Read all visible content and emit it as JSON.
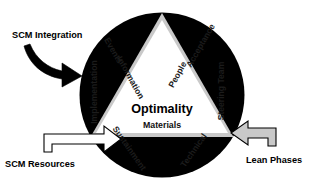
{
  "diagram": {
    "center": {
      "primary": "Optimality",
      "secondary": "Materials"
    },
    "ring_segments": [
      {
        "id": "events",
        "label": "Events"
      },
      {
        "id": "acceptance",
        "label": "Acceptance"
      },
      {
        "id": "steering-team",
        "label": "Steering Team"
      },
      {
        "id": "technical",
        "label": "Technical"
      },
      {
        "id": "sustainment",
        "label": "Sustainment"
      },
      {
        "id": "implementation",
        "label": "Implementation"
      }
    ],
    "inner_labels": [
      {
        "id": "information",
        "label": "Information"
      },
      {
        "id": "people",
        "label": "People"
      }
    ],
    "callouts": [
      {
        "id": "scm-integration",
        "label": "SCM Integration",
        "arrow": "black-curved-arrow"
      },
      {
        "id": "scm-resources",
        "label": "SCM Resources",
        "arrow": "white-block-arrow"
      },
      {
        "id": "lean-phases",
        "label": "Lean Phases",
        "arrow": "grey-block-arrow"
      }
    ],
    "colors": {
      "circle": "#000000",
      "ring": "#c9c9c9",
      "inner": "#ffffff",
      "text": "#111111",
      "lean_arrow_fill": "#c9c9c9",
      "resources_arrow_fill": "#ffffff",
      "integration_arrow_fill": "#000000"
    }
  }
}
